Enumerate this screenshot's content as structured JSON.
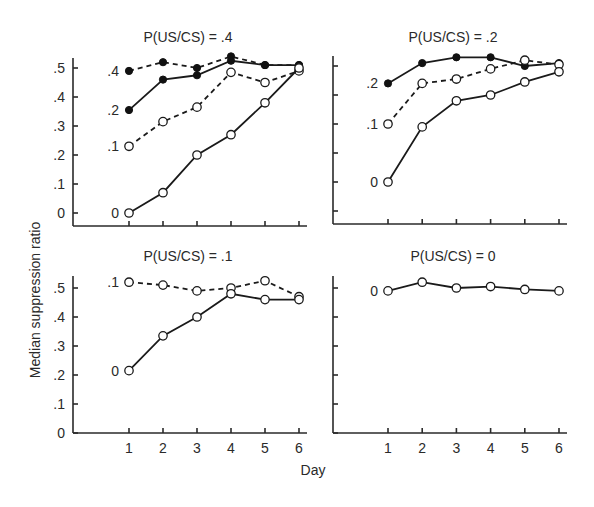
{
  "chart_data": {
    "type": "line",
    "xlabel": "Day",
    "ylabel": "Median suppression ratio",
    "x": [
      1,
      2,
      3,
      4,
      5,
      6
    ],
    "ylim": [
      0,
      0.5
    ],
    "yticks": [
      "0",
      ".1",
      ".2",
      ".3",
      ".4",
      ".5"
    ],
    "xticks": [
      "1",
      "2",
      "3",
      "4",
      "5",
      "6"
    ],
    "grid": false,
    "panels": [
      {
        "title": "P(US/CS) = .4",
        "show_ytick_labels": true,
        "show_xtick_labels": false,
        "series": [
          {
            "name": ".4",
            "style": "dashed",
            "marker": "filled",
            "values": [
              0.49,
              0.52,
              0.5,
              0.54,
              0.51,
              0.51
            ]
          },
          {
            "name": ".2",
            "style": "solid",
            "marker": "filled",
            "values": [
              0.355,
              0.46,
              0.475,
              0.525,
              0.51,
              0.51
            ]
          },
          {
            "name": ".1",
            "style": "dashed",
            "marker": "open",
            "values": [
              0.23,
              0.315,
              0.365,
              0.485,
              0.45,
              0.49
            ]
          },
          {
            "name": "0",
            "style": "solid",
            "marker": "open",
            "values": [
              0.0,
              0.07,
              0.2,
              0.27,
              0.38,
              0.5
            ]
          }
        ]
      },
      {
        "title": "P(US/CS) = .2",
        "show_ytick_labels": false,
        "show_xtick_labels": false,
        "series": [
          {
            "name": ".2",
            "style": "solid",
            "marker": "filled",
            "values": [
              0.44,
              0.51,
              0.53,
              0.53,
              0.5,
              0.51
            ]
          },
          {
            "name": ".1",
            "style": "dashed",
            "marker": "open",
            "values": [
              0.3,
              0.44,
              0.455,
              0.49,
              0.52,
              0.505
            ]
          },
          {
            "name": "0",
            "style": "solid",
            "marker": "open",
            "values": [
              0.1,
              0.29,
              0.38,
              0.4,
              0.445,
              0.48
            ]
          }
        ]
      },
      {
        "title": "P(US/CS) = .1",
        "show_ytick_labels": true,
        "show_xtick_labels": true,
        "series": [
          {
            "name": ".1",
            "style": "dashed",
            "marker": "open",
            "values": [
              0.52,
              0.51,
              0.49,
              0.5,
              0.525,
              0.47
            ]
          },
          {
            "name": "0",
            "style": "solid",
            "marker": "open",
            "values": [
              0.215,
              0.335,
              0.4,
              0.48,
              0.46,
              0.46
            ]
          }
        ]
      },
      {
        "title": "P(US/CS) = 0",
        "show_ytick_labels": false,
        "show_xtick_labels": true,
        "series": [
          {
            "name": "0",
            "style": "solid",
            "marker": "open",
            "values": [
              0.49,
              0.52,
              0.5,
              0.505,
              0.495,
              0.49
            ]
          }
        ]
      }
    ]
  }
}
